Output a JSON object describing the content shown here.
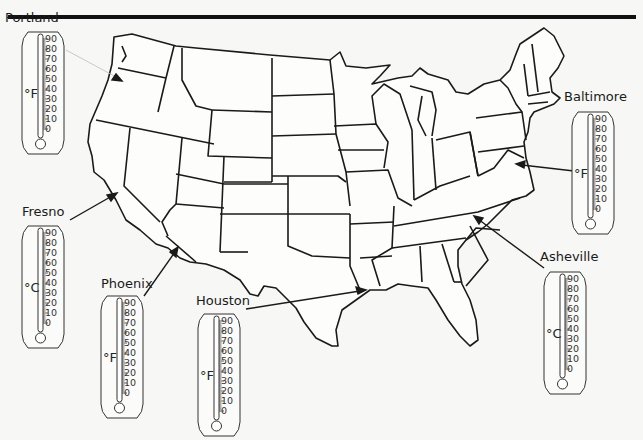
{
  "figure": {
    "type": "US map with city thermometers",
    "scale_ticks": [
      "90",
      "80",
      "70",
      "60",
      "50",
      "40",
      "30",
      "20",
      "10",
      "0"
    ]
  },
  "cities": [
    {
      "name": "Portland",
      "unit": "°F",
      "label_pos": [
        5,
        10
      ],
      "thermo_pos": [
        20,
        28
      ]
    },
    {
      "name": "Fresno",
      "unit": "°C",
      "label_pos": [
        22,
        204
      ],
      "thermo_pos": [
        20,
        222
      ]
    },
    {
      "name": "Phoenix",
      "unit": "°F",
      "label_pos": [
        101,
        276
      ],
      "thermo_pos": [
        99,
        292
      ]
    },
    {
      "name": "Houston",
      "unit": "°F",
      "label_pos": [
        196,
        293
      ],
      "thermo_pos": [
        196,
        310
      ]
    },
    {
      "name": "Baltimore",
      "unit": "°F",
      "label_pos": [
        564,
        89
      ],
      "thermo_pos": [
        570,
        108
      ]
    },
    {
      "name": "Asheville",
      "unit": "°C",
      "label_pos": [
        540,
        249
      ],
      "thermo_pos": [
        542,
        268
      ]
    }
  ]
}
